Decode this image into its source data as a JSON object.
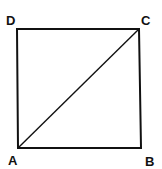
{
  "diagram": {
    "type": "square-with-diagonal",
    "vertices": [
      {
        "label": "A",
        "x": 18,
        "y": 148
      },
      {
        "label": "B",
        "x": 141,
        "y": 148
      },
      {
        "label": "C",
        "x": 139,
        "y": 29
      },
      {
        "label": "D",
        "x": 17,
        "y": 29
      }
    ],
    "edges": [
      "AB",
      "BC",
      "CD",
      "DA"
    ],
    "diagonals": [
      "AC"
    ],
    "labels": {
      "A": "A",
      "B": "B",
      "C": "C",
      "D": "D"
    },
    "colors": {
      "stroke": "#111111",
      "background": "#ffffff"
    }
  }
}
